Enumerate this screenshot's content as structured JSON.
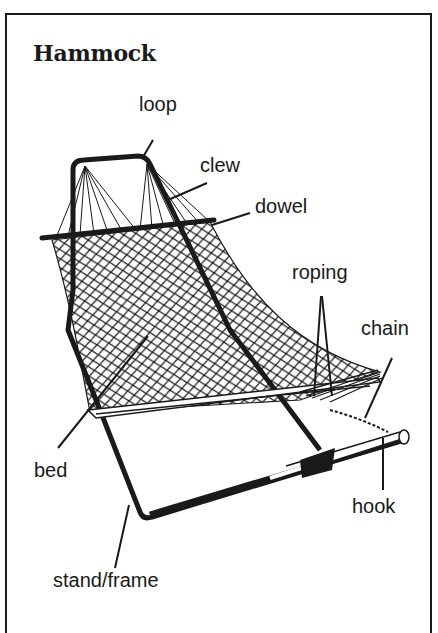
{
  "title": "Hammock",
  "labels": {
    "loop": "loop",
    "clew": "clew",
    "dowel": "dowel",
    "roping": "roping",
    "chain": "chain",
    "bed": "bed",
    "hook": "hook",
    "stand_frame": "stand/frame"
  },
  "colors": {
    "ink": "#1a1a1a",
    "background": "#ffffff"
  }
}
